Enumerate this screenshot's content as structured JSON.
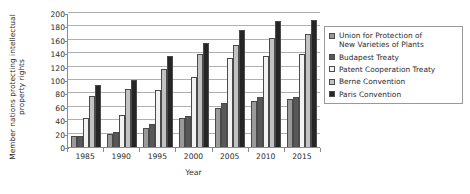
{
  "chart_data": {
    "type": "bar",
    "title": "",
    "xlabel": "Year",
    "ylabel": "Member nations protecting intellectual property rights",
    "categories": [
      "1985",
      "1990",
      "1995",
      "2000",
      "2005",
      "2010",
      "2015"
    ],
    "ylim": [
      0,
      200
    ],
    "yticks": [
      0,
      20,
      40,
      60,
      80,
      100,
      120,
      140,
      160,
      180,
      200
    ],
    "grid": true,
    "legend_position": "right",
    "series": [
      {
        "name": "Union for Protection of\nNew Varieties of Plants",
        "color": "#9a9a9a",
        "values": [
          17,
          19,
          29,
          43,
          58,
          68,
          71
        ]
      },
      {
        "name": "Budapest Treaty",
        "color": "#585858",
        "values": [
          16,
          22,
          34,
          46,
          65,
          74,
          75
        ]
      },
      {
        "name": "Patent Cooperation Treaty",
        "color": "#f2f2f2",
        "values": [
          44,
          48,
          85,
          104,
          133,
          136,
          139
        ]
      },
      {
        "name": "Berne Convention",
        "color": "#c2c2c2",
        "values": [
          76,
          86,
          116,
          139,
          152,
          163,
          169
        ]
      },
      {
        "name": "Paris Convention",
        "color": "#252525",
        "values": [
          93,
          100,
          136,
          155,
          174,
          188,
          190
        ]
      }
    ]
  }
}
